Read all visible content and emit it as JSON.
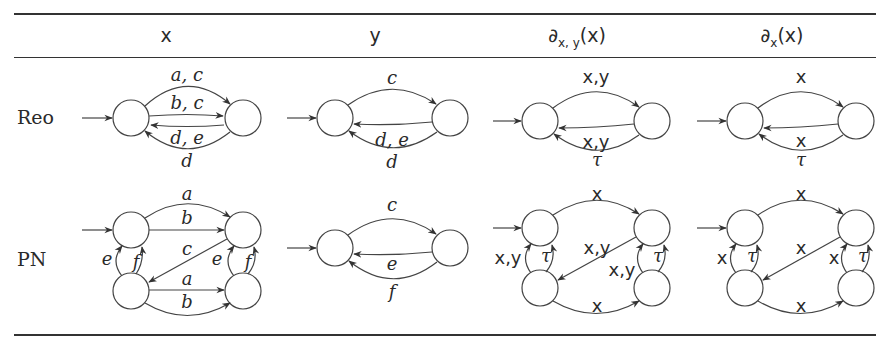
{
  "table": {
    "columns": [
      {
        "label": "x"
      },
      {
        "label": "y"
      },
      {
        "label": "∂x,y(x)",
        "sym": "∂",
        "sub": "x, y",
        "arg": "(x)"
      },
      {
        "label": "∂x(x)",
        "sym": "∂",
        "sub": "x",
        "arg": "(x)"
      }
    ],
    "rows": [
      {
        "label": "Reo"
      },
      {
        "label": "PN"
      }
    ]
  },
  "diagrams": {
    "reo_x": {
      "edges": [
        "a, c",
        "b, c",
        "d, e",
        "d"
      ]
    },
    "reo_y": {
      "edges": [
        "c",
        "d, e",
        "d"
      ]
    },
    "reo_dxy": {
      "edges": [
        "x,y",
        "x,y",
        "τ"
      ]
    },
    "reo_dx": {
      "edges": [
        "x",
        "x",
        "τ"
      ]
    },
    "pn_x": {
      "edges": [
        "a",
        "b",
        "c",
        "e",
        "f",
        "e",
        "f",
        "a",
        "b"
      ]
    },
    "pn_y": {
      "edges": [
        "c",
        "e",
        "f"
      ]
    },
    "pn_dxy": {
      "edges": [
        "x",
        "x,y",
        "τ",
        "x,y",
        "x,y",
        "τ",
        "x"
      ]
    },
    "pn_dx": {
      "edges": [
        "x",
        "x",
        "τ",
        "x",
        "x",
        "τ",
        "x"
      ]
    }
  }
}
